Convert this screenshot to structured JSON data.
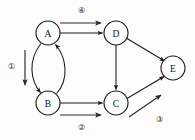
{
  "figure": {
    "type": "directed-graph-diagram",
    "background_color": "#fdfdfd",
    "stroke_color": "#1a1a1a",
    "width": 195,
    "height": 140
  },
  "nodes": [
    {
      "id": "A",
      "label": "A",
      "cx": 48,
      "cy": 33,
      "r": 12
    },
    {
      "id": "B",
      "label": "B",
      "cx": 48,
      "cy": 103,
      "r": 12
    },
    {
      "id": "C",
      "label": "C",
      "cx": 116,
      "cy": 103,
      "r": 12
    },
    {
      "id": "D",
      "label": "D",
      "cx": 116,
      "cy": 33,
      "r": 12
    },
    {
      "id": "E",
      "label": "E",
      "cx": 173,
      "cy": 68,
      "r": 12
    }
  ],
  "edges": [
    {
      "id": "A-D",
      "from": "A",
      "to": "D",
      "shape": "straight",
      "direction": "right"
    },
    {
      "id": "A-B",
      "from": "A",
      "to": "B",
      "shape": "curve-left",
      "direction": "down"
    },
    {
      "id": "B-A",
      "from": "B",
      "to": "A",
      "shape": "curve-right",
      "direction": "up"
    },
    {
      "id": "B-C",
      "from": "B",
      "to": "C",
      "shape": "straight",
      "direction": "right"
    },
    {
      "id": "D-C",
      "from": "D",
      "to": "C",
      "shape": "straight",
      "direction": "down"
    },
    {
      "id": "D-E",
      "from": "D",
      "to": "E",
      "shape": "straight",
      "direction": "down-right"
    },
    {
      "id": "C-E",
      "from": "C",
      "to": "E",
      "shape": "straight",
      "direction": "up-right"
    }
  ],
  "annotations": [
    {
      "id": "annot-1",
      "label": "①",
      "number": 1,
      "label_x": 11,
      "label_y": 66,
      "arrow": {
        "x1": 25,
        "y1": 50,
        "x2": 25,
        "y2": 86,
        "direction": "down"
      }
    },
    {
      "id": "annot-2",
      "label": "②",
      "number": 2,
      "label_x": 81,
      "label_y": 127,
      "arrow": {
        "x1": 60,
        "y1": 115,
        "x2": 101,
        "y2": 115,
        "direction": "right"
      }
    },
    {
      "id": "annot-3",
      "label": "③",
      "number": 3,
      "label_x": 159,
      "label_y": 119,
      "arrow": {
        "x1": 129,
        "y1": 117,
        "x2": 162,
        "y2": 95,
        "direction": "up-right"
      }
    },
    {
      "id": "annot-4",
      "label": "④",
      "number": 4,
      "label_x": 81,
      "label_y": 10,
      "arrow": {
        "x1": 60,
        "y1": 23,
        "x2": 101,
        "y2": 23,
        "direction": "right"
      }
    }
  ]
}
